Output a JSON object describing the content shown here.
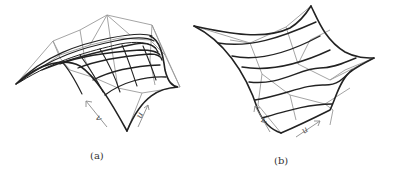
{
  "figure": {
    "panels": [
      {
        "id": "a",
        "caption": "(a)",
        "description": "Dome-shaped surface with gray control net and black isoparametric curves",
        "axes": {
          "u": "u",
          "v": "v"
        }
      },
      {
        "id": "b",
        "caption": "(b)",
        "description": "Saddle-like twisted surface with gray control net and black isoparametric curves",
        "axes": {
          "u": "u",
          "v": "v"
        }
      }
    ],
    "colors": {
      "control_net": "#9a9a9a",
      "surface_curves": "#222222",
      "arrows": "#8a8a8a",
      "background": "#ffffff"
    }
  }
}
